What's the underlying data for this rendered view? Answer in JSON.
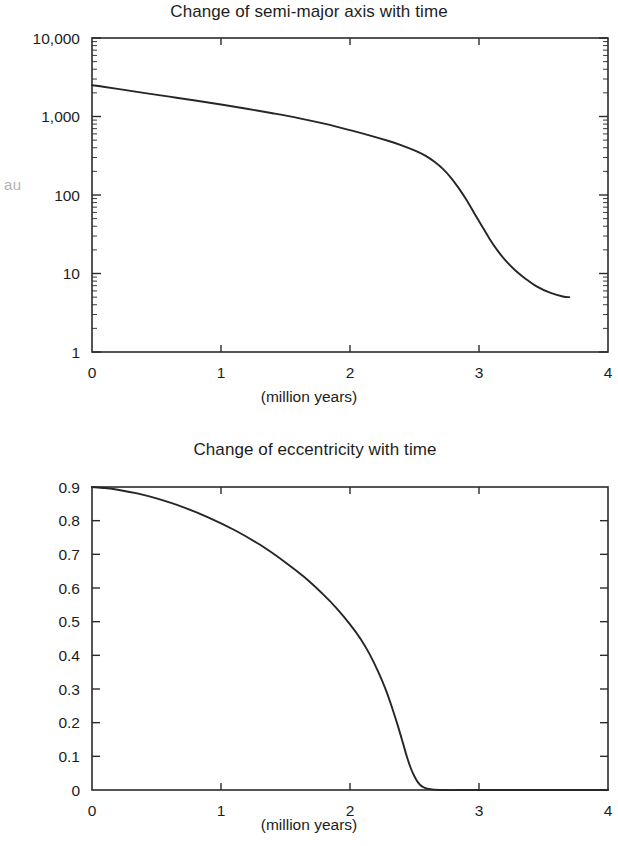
{
  "figures": [
    {
      "id": "semimajor",
      "title": "Change of semi-major axis with time",
      "y_axis_label": "au",
      "x_axis_caption": "(million years)"
    },
    {
      "id": "eccentricity",
      "title": "Change of eccentricity with time",
      "y_axis_label": "Eccentricity",
      "x_axis_caption": "(million years)"
    }
  ],
  "chart_data": [
    {
      "type": "line",
      "title": "Change of semi-major axis with time",
      "xlabel": "(million years)",
      "ylabel": "au",
      "yscale": "log",
      "xscale": "linear",
      "xlim": [
        0,
        4
      ],
      "ylim": [
        1,
        10000
      ],
      "grid": false,
      "legend": false,
      "xticks": [
        "0",
        "1",
        "2",
        "3",
        "4"
      ],
      "xtick_values": [
        0,
        1,
        2,
        3,
        4
      ],
      "yticks": [
        "1",
        "10",
        "100",
        "1,000",
        "10,000"
      ],
      "ytick_values": [
        1,
        10,
        100,
        1000,
        10000
      ],
      "minor_ticks": "log decades 2-9",
      "series": [
        {
          "name": "semi-major axis",
          "x": [
            0.0,
            0.1,
            0.25,
            0.4,
            0.6,
            0.8,
            1.0,
            1.2,
            1.4,
            1.6,
            1.8,
            2.0,
            2.15,
            2.3,
            2.4,
            2.5,
            2.58,
            2.66,
            2.72,
            2.78,
            2.84,
            2.9,
            2.96,
            3.02,
            3.08,
            3.14,
            3.2,
            3.28,
            3.36,
            3.45,
            3.55,
            3.65,
            3.7
          ],
          "y": [
            2500,
            2380,
            2180,
            2000,
            1790,
            1600,
            1420,
            1255,
            1100,
            955,
            810,
            670,
            575,
            487,
            430,
            370,
            320,
            262,
            215,
            168,
            124,
            88,
            60,
            41,
            28,
            20,
            15,
            11.0,
            8.6,
            6.8,
            5.7,
            5.1,
            5.0
          ]
        }
      ]
    },
    {
      "type": "line",
      "title": "Change of eccentricity with time",
      "xlabel": "(million years)",
      "ylabel": "Eccentricity",
      "yscale": "linear",
      "xscale": "linear",
      "xlim": [
        0,
        4
      ],
      "ylim": [
        0,
        0.9
      ],
      "grid": false,
      "legend": false,
      "xticks": [
        "0",
        "1",
        "2",
        "3",
        "4"
      ],
      "xtick_values": [
        0,
        1,
        2,
        3,
        4
      ],
      "yticks": [
        "0",
        "0.1",
        "0.2",
        "0.3",
        "0.4",
        "0.5",
        "0.6",
        "0.7",
        "0.8",
        "0.9"
      ],
      "ytick_values": [
        0,
        0.1,
        0.2,
        0.3,
        0.4,
        0.5,
        0.6,
        0.7,
        0.8,
        0.9
      ],
      "series": [
        {
          "name": "eccentricity",
          "x": [
            0.0,
            0.1,
            0.2,
            0.35,
            0.5,
            0.7,
            0.9,
            1.1,
            1.3,
            1.5,
            1.65,
            1.8,
            1.9,
            2.0,
            2.08,
            2.15,
            2.22,
            2.28,
            2.33,
            2.37,
            2.41,
            2.44,
            2.47,
            2.5,
            2.53,
            2.56,
            2.6,
            2.7,
            3.0,
            3.5,
            4.0
          ],
          "y": [
            0.9,
            0.897,
            0.892,
            0.881,
            0.866,
            0.841,
            0.81,
            0.773,
            0.729,
            0.676,
            0.631,
            0.578,
            0.538,
            0.492,
            0.45,
            0.405,
            0.35,
            0.295,
            0.24,
            0.192,
            0.14,
            0.1,
            0.066,
            0.04,
            0.021,
            0.01,
            0.004,
            0.0,
            0.0,
            0.0,
            0.0
          ]
        }
      ]
    }
  ]
}
